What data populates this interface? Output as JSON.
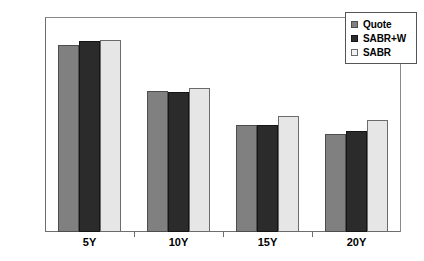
{
  "chart_data": {
    "type": "bar",
    "title": "",
    "subtitle": "",
    "xlabel": "",
    "ylabel": "",
    "categories": [
      "5Y",
      "10Y",
      "15Y",
      "20Y"
    ],
    "series": [
      {
        "name": "Quote",
        "color": "#808080",
        "values": [
          139,
          105,
          80,
          73
        ]
      },
      {
        "name": "SABR+W",
        "color": "#2b2b2b",
        "values": [
          142,
          104,
          80,
          75
        ]
      },
      {
        "name": "SABR",
        "color": "#e6e6e6",
        "values": [
          143,
          107,
          86,
          83
        ]
      }
    ],
    "ylim": [
      0,
      160
    ],
    "yticks": [
      0,
      40,
      80,
      120,
      160
    ],
    "ytick_labels": [
      "0",
      "40",
      "80",
      "120",
      "160"
    ],
    "grid": false,
    "legend_position": "top-right",
    "legend_entries": [
      "Quote",
      "SABR+W",
      "SABR"
    ]
  },
  "legend": {
    "items": [
      {
        "label": "Quote",
        "swatch": "legend-swatch-quote"
      },
      {
        "label": "SABR+W",
        "swatch": "legend-swatch-sabrw"
      },
      {
        "label": "SABR",
        "swatch": "legend-swatch-sabr"
      }
    ]
  },
  "axes": {
    "y_tick_labels": [
      "160",
      "120",
      "80",
      "40",
      "0"
    ],
    "x_tick_labels": [
      "5Y",
      "10Y",
      "15Y",
      "20Y"
    ]
  }
}
